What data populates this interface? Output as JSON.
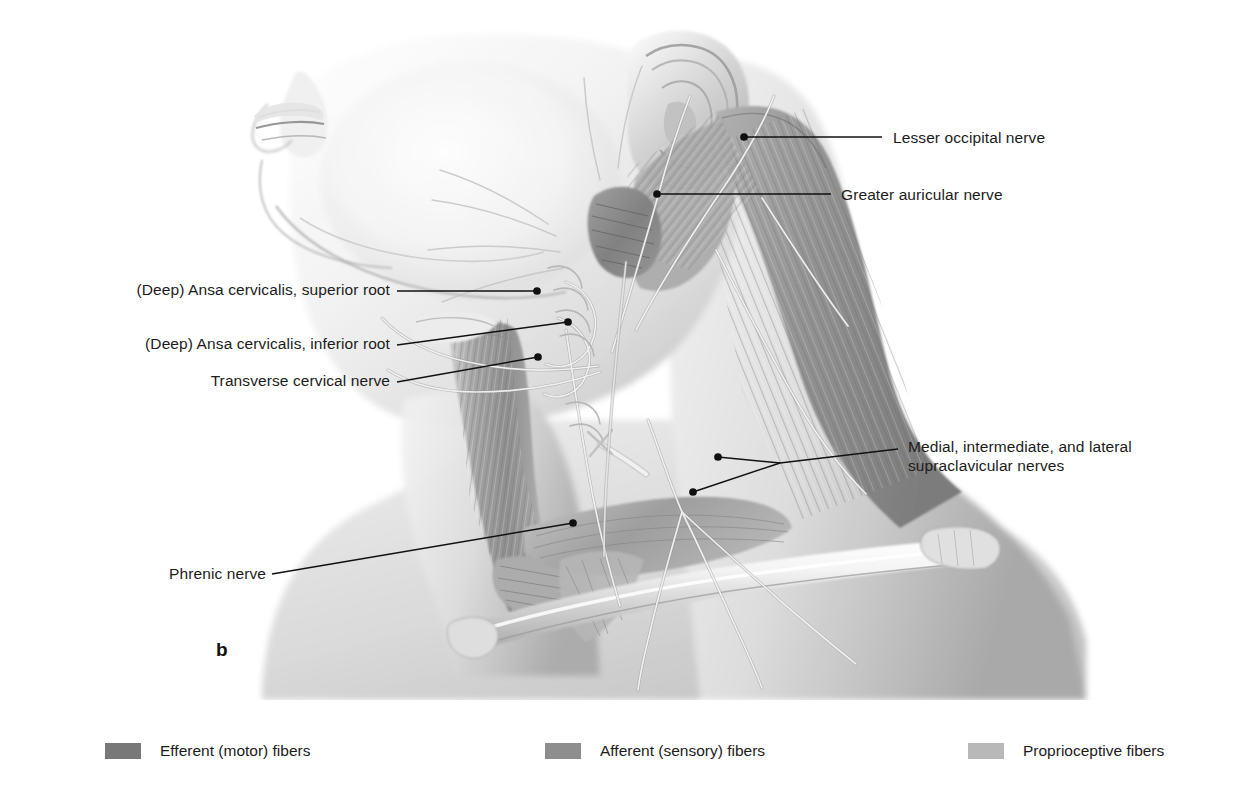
{
  "figure": {
    "letter": "b",
    "background_color": "#ffffff",
    "line_color": "#111111",
    "ink_color": "#1c1c1c"
  },
  "labels": [
    {
      "id": "ansa-cervicalis-superior-root",
      "text": "(Deep) Ansa cervicalis, superior root",
      "side": "left",
      "text_x": 60,
      "text_y": 280,
      "text_width": 330,
      "leader": [
        [
          397,
          291
        ],
        [
          537,
          291
        ]
      ],
      "dot": [
        537,
        291
      ]
    },
    {
      "id": "ansa-cervicalis-inferior-root",
      "text": "(Deep) Ansa cervicalis, inferior root",
      "side": "left",
      "text_x": 86,
      "text_y": 334,
      "text_width": 304,
      "leader": [
        [
          397,
          345
        ],
        [
          568,
          322
        ]
      ],
      "dot": [
        568,
        322
      ]
    },
    {
      "id": "transverse-cervical-nerve",
      "text": "Transverse cervical nerve",
      "side": "left",
      "text_x": 166,
      "text_y": 371,
      "text_width": 224,
      "leader": [
        [
          397,
          382
        ],
        [
          538,
          357
        ]
      ],
      "dot": [
        538,
        357
      ]
    },
    {
      "id": "phrenic-nerve",
      "text": "Phrenic nerve",
      "side": "left",
      "text_x": 149,
      "text_y": 564,
      "text_width": 117,
      "leader": [
        [
          272,
          574
        ],
        [
          573,
          523
        ]
      ],
      "dot": [
        573,
        523
      ]
    },
    {
      "id": "lesser-occipital-nerve",
      "text": "Lesser occipital nerve",
      "side": "right",
      "text_x": 893,
      "text_y": 129,
      "leader": [
        [
          744,
          137
        ],
        [
          882,
          137
        ]
      ],
      "dot": [
        744,
        137
      ]
    },
    {
      "id": "greater-auricular-nerve",
      "text": "Greater auricular nerve",
      "side": "right",
      "text_x": 841,
      "text_y": 186,
      "leader": [
        [
          657,
          194
        ],
        [
          831,
          194
        ]
      ],
      "dot": [
        657,
        194
      ]
    },
    {
      "id": "supraclavicular-nerves",
      "text": "Medial, intermediate, and lateral\nsupraclavicular nerves",
      "side": "right",
      "text_x": 908,
      "text_y": 439,
      "leader": [
        [
          780,
          463
        ],
        [
          898,
          449
        ]
      ],
      "branch": [
        [
          718,
          457
        ],
        [
          780,
          463
        ],
        [
          693,
          492
        ]
      ],
      "dots": [
        [
          718,
          457
        ],
        [
          693,
          492
        ]
      ]
    }
  ],
  "legend": {
    "items": [
      {
        "label": "Efferent (motor) fibers",
        "color": "#787878"
      },
      {
        "label": "Afferent (sensory) fibers",
        "color": "#8e8e8e"
      },
      {
        "label": "Proprioceptive fibers",
        "color": "#b8b8b8"
      }
    ]
  }
}
